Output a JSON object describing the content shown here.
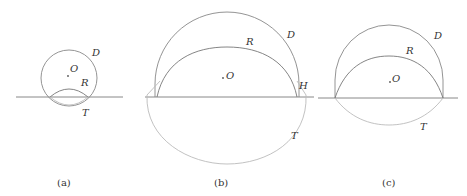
{
  "figures": [
    {
      "id": "a",
      "caption": "(a)",
      "labels": {
        "D": "D",
        "O": "O",
        "R": "R",
        "T": "T"
      }
    },
    {
      "id": "b",
      "caption": "(b)",
      "labels": {
        "D": "D",
        "O": "O",
        "R": "R",
        "H": "H",
        "T": "T"
      }
    },
    {
      "id": "c",
      "caption": "(c)",
      "labels": {
        "D": "D",
        "O": "O",
        "R": "R",
        "T": "T"
      }
    }
  ],
  "colors": {
    "dark_curve": "#777777",
    "light_curve": "#bbbbbb",
    "line": "#888888"
  }
}
